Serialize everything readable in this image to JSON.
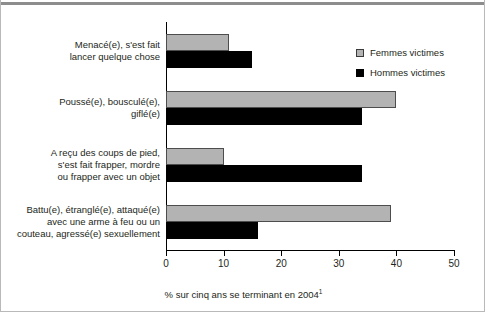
{
  "chart_data": {
    "type": "bar",
    "orientation": "horizontal",
    "title": "",
    "xlabel": "% sur cinq ans se terminant en 2004",
    "xlabel_footnote": "1",
    "ylabel": "",
    "xlim": [
      0,
      50
    ],
    "xticks": [
      0,
      10,
      20,
      30,
      40,
      50
    ],
    "xticklabels": [
      "0",
      "10",
      "20",
      "30",
      "40",
      "50"
    ],
    "grid": false,
    "legend_position": "upper right",
    "categories": [
      "Menacé(e), s'est fait lancer quelque chose",
      "Poussé(e), bousculé(e), giflé(e)",
      "A reçu des coups de pied, s'est fait frapper, mordre ou frapper avec un objet",
      "Battu(e), étranglé(e), attaqué(e) avec une arme à feu ou un couteau, agressé(e) sexuellement"
    ],
    "category_lines": [
      [
        "Menacé(e), s'est fait",
        "lancer quelque chose"
      ],
      [
        "Poussé(e), bousculé(e),",
        "giflé(e)"
      ],
      [
        "A reçu des coups de pied,",
        "s'est fait frapper, mordre",
        "ou frapper avec un objet"
      ],
      [
        "Battu(e), étranglé(e), attaqué(e)",
        "avec une arme à feu ou un",
        "couteau, agressé(e) sexuellement"
      ]
    ],
    "series": [
      {
        "name": "Femmes victimes",
        "color": "#b3b3b3",
        "values": [
          11,
          40,
          10,
          39
        ]
      },
      {
        "name": "Hommes victimes",
        "color": "#000000",
        "values": [
          15,
          34,
          34,
          16
        ]
      }
    ]
  },
  "legend": {
    "items": [
      {
        "label": "Femmes victimes"
      },
      {
        "label": "Hommes victimes"
      }
    ]
  }
}
